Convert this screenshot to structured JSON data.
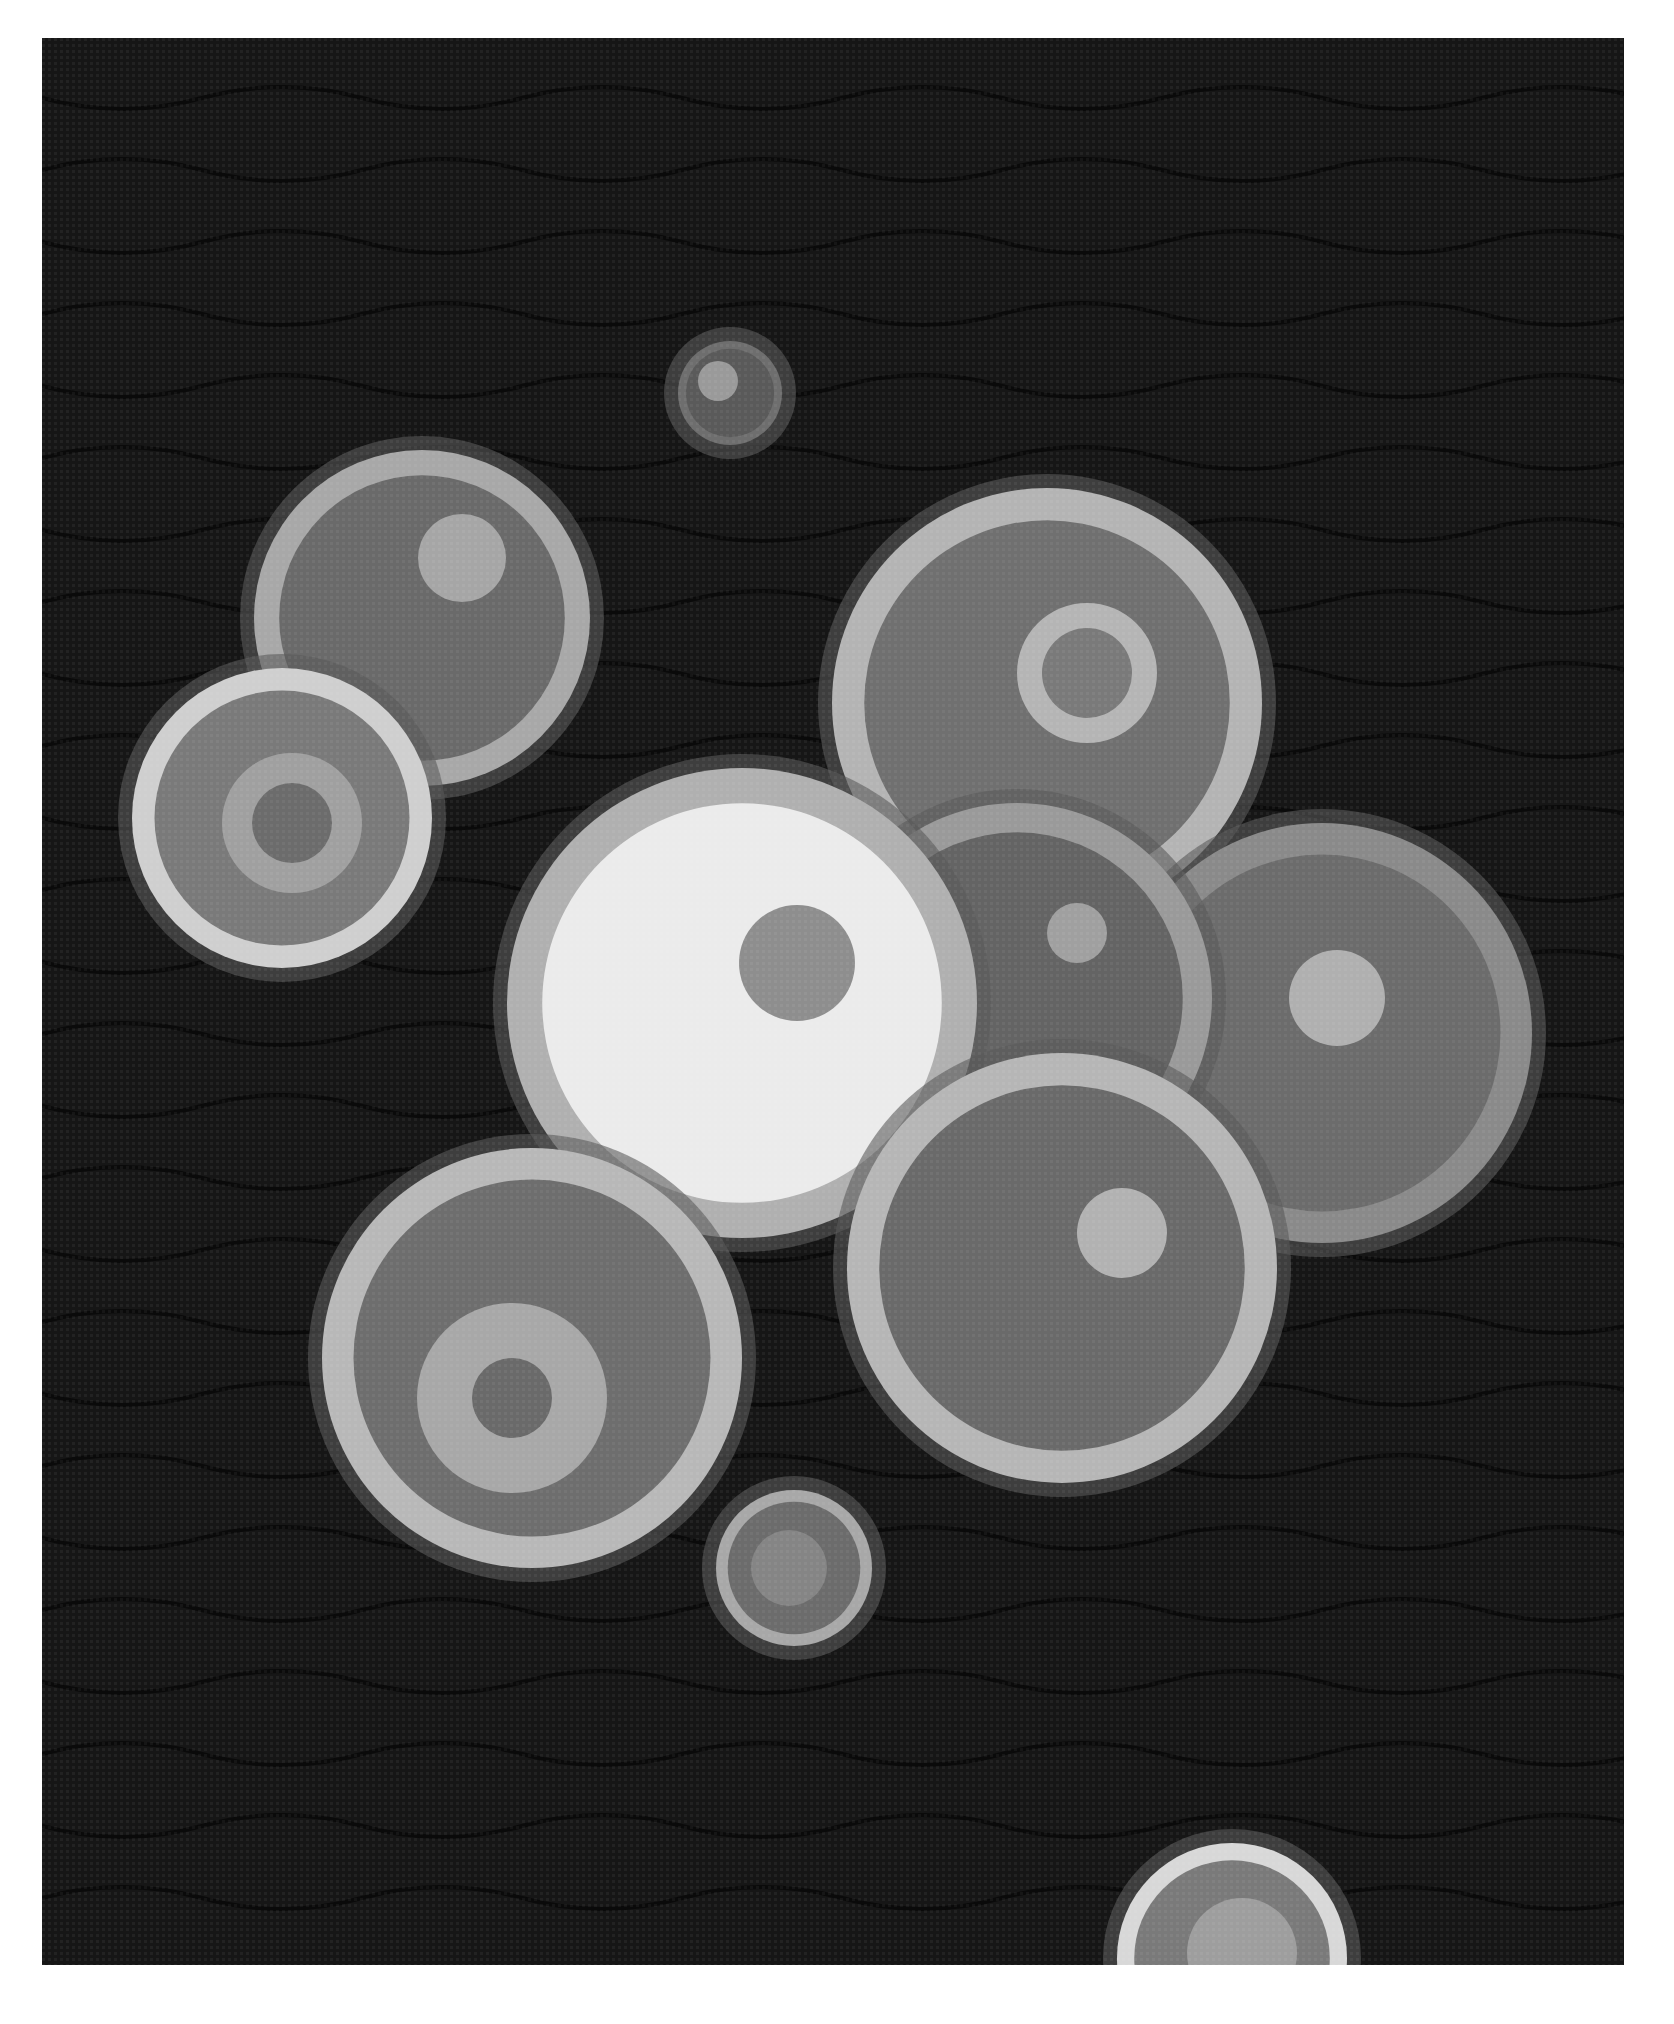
{
  "image": {
    "subject": "textile artwork of overlapping circles on dark fabric",
    "background_color": "#161616",
    "frame_color": "#ffffff"
  },
  "circles": [
    {
      "cx": 688,
      "cy": 355,
      "r": 52,
      "rim": "#6e6e6e",
      "fill": "#5a5a5a",
      "spot": {
        "dx": -12,
        "dy": -12,
        "r": 20,
        "color": "#9a9a9a"
      }
    },
    {
      "cx": 380,
      "cy": 580,
      "r": 168,
      "rim": "#a8a8a8",
      "fill": "#6a6a6a",
      "spot": {
        "dx": 40,
        "dy": -60,
        "r": 44,
        "color": "#a6a6a6"
      }
    },
    {
      "cx": 240,
      "cy": 780,
      "r": 150,
      "rim": "#cfcfcf",
      "fill": "#7a7a7a",
      "spot": {
        "dx": 10,
        "dy": 5,
        "r": 70,
        "color": "#a0a0a0",
        "inner": {
          "r": 40,
          "color": "#6c6c6c"
        }
      }
    },
    {
      "cx": 1005,
      "cy": 665,
      "r": 215,
      "rim": "#b4b4b4",
      "fill": "#707070",
      "spot": {
        "dx": 40,
        "dy": -30,
        "r": 70,
        "color": "#b5b5b5",
        "inner": {
          "r": 45,
          "color": "#7a7a7a"
        }
      }
    },
    {
      "cx": 1280,
      "cy": 995,
      "r": 210,
      "rim": "#8a8a8a",
      "fill": "#6c6c6c",
      "spot": {
        "dx": 15,
        "dy": -35,
        "r": 48,
        "color": "#b0b0b0"
      }
    },
    {
      "cx": 975,
      "cy": 960,
      "r": 195,
      "rim": "#9a9a9a",
      "fill": "#646464",
      "spot": {
        "dx": 60,
        "dy": -65,
        "r": 30,
        "color": "#a0a0a0"
      }
    },
    {
      "cx": 700,
      "cy": 965,
      "r": 235,
      "rim": "#b0b0b0",
      "fill": "#ebebeb",
      "spot": {
        "dx": 55,
        "dy": -40,
        "r": 58,
        "color": "#8e8e8e"
      }
    },
    {
      "cx": 1020,
      "cy": 1230,
      "r": 215,
      "rim": "#b6b6b6",
      "fill": "#6a6a6a",
      "spot": {
        "dx": 60,
        "dy": -35,
        "r": 45,
        "color": "#b2b2b2"
      }
    },
    {
      "cx": 490,
      "cy": 1320,
      "r": 210,
      "rim": "#b8b8b8",
      "fill": "#6e6e6e",
      "spot": {
        "dx": -20,
        "dy": 40,
        "r": 95,
        "color": "#a8a8a8",
        "inner": {
          "r": 40,
          "color": "#6a6a6a"
        }
      }
    },
    {
      "cx": 752,
      "cy": 1530,
      "r": 78,
      "rim": "#a8a8a8",
      "fill": "#6c6c6c",
      "spot": {
        "dx": -5,
        "dy": 0,
        "r": 38,
        "color": "#858585"
      }
    },
    {
      "cx": 1190,
      "cy": 1920,
      "r": 115,
      "rim": "#d8d8d8",
      "fill": "#7a7a7a",
      "spot": {
        "dx": 10,
        "dy": -5,
        "r": 55,
        "color": "#9e9e9e"
      }
    }
  ]
}
